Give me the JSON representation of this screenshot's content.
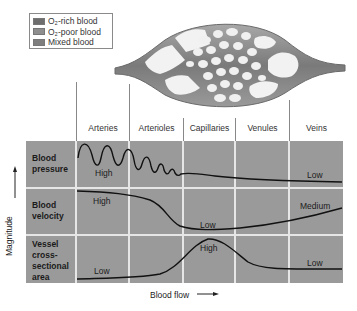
{
  "legend": {
    "items": [
      {
        "label": "O₂-rich blood",
        "color": "#6e6e6e"
      },
      {
        "label": "O₂-poor blood",
        "color": "#8e8e8e"
      },
      {
        "label": "Mixed blood",
        "color": "#7e7e7e"
      }
    ]
  },
  "columns": [
    "Arteries",
    "Arterioles",
    "Capillaries",
    "Venules",
    "Veins"
  ],
  "rows": [
    {
      "label_line1": "Blood",
      "label_line2": "pressure",
      "label_line3": "",
      "label_line4": ""
    },
    {
      "label_line1": "Blood",
      "label_line2": "velocity",
      "label_line3": "",
      "label_line4": ""
    },
    {
      "label_line1": "Vessel",
      "label_line2": "cross-",
      "label_line3": "sectional",
      "label_line4": "area"
    }
  ],
  "annotations": {
    "pressure_high": "High",
    "pressure_low": "Low",
    "velocity_high": "High",
    "velocity_low": "Low",
    "velocity_medium": "Medium",
    "area_low_left": "Low",
    "area_high": "High",
    "area_low_right": "Low"
  },
  "axes": {
    "y_label": "Magnitude",
    "x_label": "Blood flow"
  },
  "colors": {
    "grid_bg": "#9a9a9a",
    "grid_lines": "#e6e6e6",
    "curve": "#111111",
    "vessel": "#8c8c8c"
  }
}
